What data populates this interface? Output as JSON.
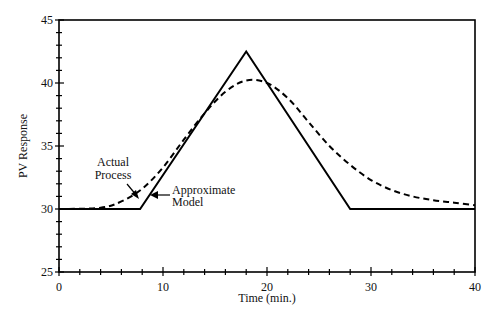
{
  "chart_data": {
    "type": "line",
    "title": "",
    "xlabel": "Time (min.)",
    "ylabel": "PV Response",
    "xlim": [
      0,
      40
    ],
    "ylim": [
      25,
      45
    ],
    "xticks": [
      0,
      10,
      20,
      30,
      40
    ],
    "yticks": [
      25,
      30,
      35,
      40,
      45
    ],
    "grid": false,
    "legend": null,
    "series": [
      {
        "name": "Approximate Model",
        "style": "solid",
        "x": [
          0,
          7.8,
          18,
          28,
          40
        ],
        "y": [
          30,
          30,
          42.5,
          30,
          30
        ]
      },
      {
        "name": "Actual Process",
        "style": "dashed",
        "x": [
          0,
          4,
          6,
          8,
          10,
          12,
          14,
          16,
          18,
          20,
          22,
          24,
          26,
          28,
          30,
          32,
          34,
          36,
          38,
          40
        ],
        "y": [
          30,
          30.1,
          30.6,
          31.6,
          33.3,
          35.5,
          37.6,
          39.3,
          40.2,
          40.0,
          38.8,
          36.9,
          35.0,
          33.5,
          32.3,
          31.5,
          31.0,
          30.7,
          30.5,
          30.3
        ]
      }
    ],
    "annotations": [
      {
        "text": "Actual\nProcess",
        "arrow_to": [
          8.5,
          31.2
        ]
      },
      {
        "text": "Approximate\nModel",
        "arrow_to": [
          9.5,
          32.0
        ]
      }
    ]
  },
  "labels": {
    "xlabel": "Time (min.)",
    "ylabel": "PV Response",
    "xticks": [
      "0",
      "10",
      "20",
      "30",
      "40"
    ],
    "yticks": [
      "25",
      "30",
      "35",
      "40",
      "45"
    ],
    "annot_actual_1": "Actual",
    "annot_actual_2": "Process",
    "annot_model_1": "Approximate",
    "annot_model_2": "Model"
  }
}
